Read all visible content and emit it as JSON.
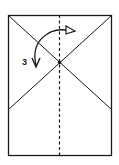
{
  "diagram": {
    "type": "origami-fold-step",
    "step_number": "3",
    "elements": {
      "paper": "rectangle",
      "creases": [
        "diagonal-top-left-to-right-side",
        "diagonal-top-right-to-left-side"
      ],
      "fold_line": "vertical-valley-fold-center-dashed",
      "arrow": "curved-fold-arrow-with-hollow-head",
      "reference_point": "center-intersection-dot"
    },
    "colors": {
      "line": "#1a1a1a",
      "background": "#ffffff"
    }
  }
}
